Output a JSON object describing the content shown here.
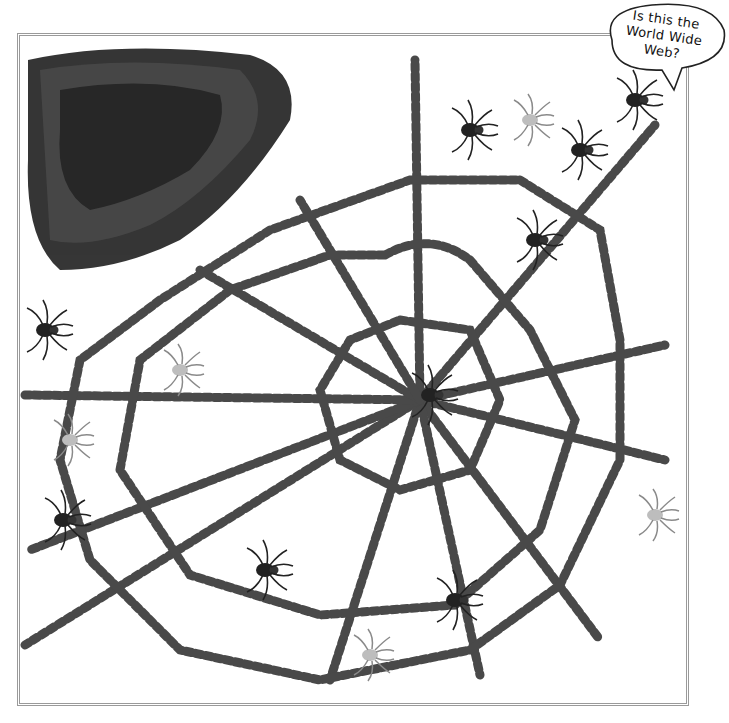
{
  "image": {
    "description": "A spider web made of rows of toy spiders inside a gray double-line frame, with a dense pile of spiders in the top-left corner",
    "frame_color": "#9a9a9a",
    "web_center": [
      420,
      400
    ]
  },
  "speech_bubble": {
    "line1": "Is this the",
    "line2": "World Wide Web?"
  }
}
